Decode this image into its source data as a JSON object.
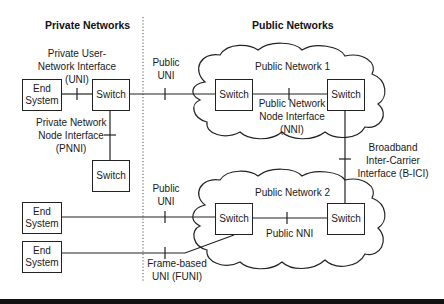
{
  "headers": {
    "private": "Private Networks",
    "public": "Public Networks"
  },
  "nodes": {
    "end_system_1": {
      "line1": "End",
      "line2": "System"
    },
    "end_system_2": {
      "line1": "End",
      "line2": "System"
    },
    "end_system_3": {
      "line1": "End",
      "line2": "System"
    },
    "private_switch_1": "Switch",
    "private_switch_2": "Switch",
    "pn1_switch_left": "Switch",
    "pn1_switch_right": "Switch",
    "pn2_switch_left": "Switch",
    "pn2_switch_right": "Switch"
  },
  "clouds": {
    "public_network_1": "Public Network 1",
    "public_network_2": "Public Network 2"
  },
  "interfaces": {
    "private_uni": {
      "line1": "Private User-",
      "line2": "Network Interface",
      "line3": "(UNI)"
    },
    "pnni": {
      "line1": "Private Network",
      "line2": "Node Interface",
      "line3": "(PNNI)"
    },
    "public_uni_1": {
      "line1": "Public",
      "line2": "UNI"
    },
    "nni": {
      "line1": "Public Network",
      "line2": "Node Interface",
      "line3": "(NNI)"
    },
    "b_ici": {
      "line1": "Broadband",
      "line2": "Inter-Carrier",
      "line3": "Interface (B-ICI)"
    },
    "public_uni_2": {
      "line1": "Public",
      "line2": "UNI"
    },
    "public_nni": "Public NNI",
    "funi": {
      "line1": "Frame-based",
      "line2": "UNI (FUNI)"
    }
  },
  "colors": {
    "line": "#222222",
    "divider": "#555555",
    "background": "#ffffff",
    "bottom_bar": "#111111"
  }
}
